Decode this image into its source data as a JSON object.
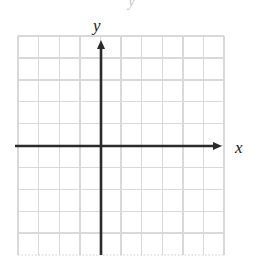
{
  "figure": {
    "kind": "cartesian-coordinate-grid",
    "background_color": "#ffffff",
    "grid": {
      "columns": 10,
      "rows": 10,
      "cell_size_px": 20.6,
      "left_px": 18,
      "top_px": 36,
      "right_px": 224,
      "bottom_px": 255,
      "line_color": "#d8d8d8",
      "line_width_px": 1.4,
      "border_color": "#dcdcdc",
      "bottom_edge_style": "dotted"
    },
    "axes": {
      "color": "#2b2b2b",
      "line_width_px": 2.6,
      "origin": {
        "x_px": 101,
        "y_px": 146
      },
      "x_axis": {
        "label": "x",
        "label_x_px": 238,
        "label_y_px": 152,
        "start_px": 15,
        "end_px": 222,
        "arrow": "right",
        "arrow_size_px": 9
      },
      "y_axis": {
        "label": "y",
        "label_x_px": 98,
        "label_y_px": 30,
        "start_px": 255,
        "end_px": 40,
        "arrow": "up",
        "arrow_size_px": 9
      }
    },
    "artifact": {
      "label": "y",
      "note": "faint cut-off glyph at top edge",
      "x_px": 128,
      "y_px": 4,
      "color": "#9a9a9a"
    },
    "data_points": [],
    "curves": [],
    "tick_labels": []
  }
}
